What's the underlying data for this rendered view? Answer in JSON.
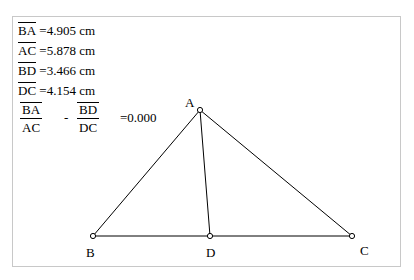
{
  "measurements": [
    {
      "segment": "BA",
      "value": "=4.905 cm"
    },
    {
      "segment": "AC",
      "value": "=5.878 cm"
    },
    {
      "segment": "BD",
      "value": "=3.466 cm"
    },
    {
      "segment": "DC",
      "value": "=4.154 cm"
    }
  ],
  "expression": {
    "frac1": {
      "num": "BA",
      "den": "AC"
    },
    "operator": "-",
    "frac2": {
      "num": "BD",
      "den": "DC"
    },
    "result": "=0.000"
  },
  "points": {
    "A": {
      "label": "A",
      "x": 200,
      "y": 110
    },
    "B": {
      "label": "B",
      "x": 93,
      "y": 236
    },
    "C": {
      "label": "C",
      "x": 352,
      "y": 236
    },
    "D": {
      "label": "D",
      "x": 210,
      "y": 236
    }
  },
  "colors": {
    "stroke": "#000000",
    "frame": "#c8c8c8"
  }
}
